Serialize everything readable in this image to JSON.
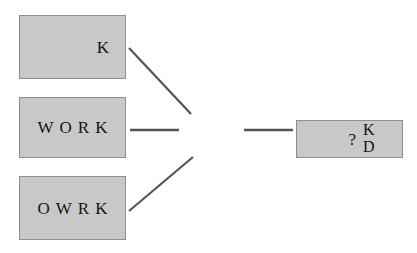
{
  "diagram": {
    "title": "",
    "colors": {
      "box_fill": "#c8c8c8",
      "box_border": "#8e8e8e",
      "line": "#555555",
      "text": "#141414",
      "background": "#ffffff"
    },
    "stimuli": [
      {
        "id": "letter-k",
        "label": "K",
        "align": "right"
      },
      {
        "id": "word-work",
        "label": "WORK",
        "align": "center"
      },
      {
        "id": "anagram-owrk",
        "label": "OWRK",
        "align": "center"
      }
    ],
    "response": {
      "query": "?",
      "options": [
        "K",
        "D"
      ]
    },
    "connectors": [
      {
        "id": "link-k-to-hub",
        "from": "letter-k",
        "to": "hub",
        "type": "diagonal-down"
      },
      {
        "id": "link-work-to-hub",
        "from": "word-work",
        "to": "hub",
        "type": "horizontal"
      },
      {
        "id": "link-owrk-to-hub",
        "from": "anagram-owrk",
        "to": "hub",
        "type": "diagonal-up"
      },
      {
        "id": "link-hub-to-response",
        "from": "hub",
        "to": "response",
        "type": "horizontal"
      }
    ]
  }
}
